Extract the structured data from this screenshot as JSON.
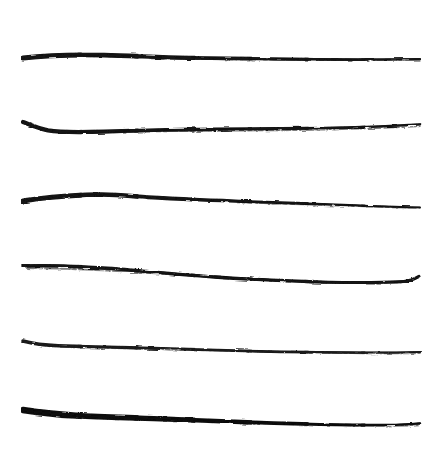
{
  "image": {
    "kind": "scanned-drawing",
    "subject": "six hand-drawn horizontal brush-ink lines",
    "width": 448,
    "height": 466,
    "background_color": "#ffffff",
    "ink_color": "#111111",
    "medium": "brush / marker on paper",
    "has_text": false,
    "has_border": false
  },
  "strokes": [
    {
      "id": "stroke-1",
      "index": 1,
      "label": "top line",
      "start_x": 23,
      "end_x": 420,
      "baseline_y": 57,
      "thickness_left": 5.2,
      "thickness_right": 2.2,
      "color": "#121212",
      "description": "thick blunt entry at left, gentle wave, tapers and dries out toward the right",
      "path": "M23,58 C48,55.2 76,54.6 104,55.2 C132,55.8 160,57.4 188,57.8 C216,58.2 244,58.4 272,58.8 C300,59.2 330,59.6 358,59.6 C382,59.6 402,59.4 420,59.2",
      "texture_path": "M150,58.6 C190,59.2 232,59.6 274,60.0 C316,60.4 360,60.4 420,60.0"
    },
    {
      "id": "stroke-2",
      "index": 2,
      "label": "second line with left hook",
      "start_x": 23,
      "end_x": 420,
      "baseline_y": 128,
      "thickness_left": 4.4,
      "thickness_right": 2.4,
      "color": "#121212",
      "description": "distinct downward hook at the left end, flat through the middle, lifts slightly at the right tip",
      "path": "M23,122 C30,124.6 38,128.4 48,130.4 C62,132.8 80,132.4 104,131.6 C140,130.4 176,129.6 212,129.2 C250,128.8 288,128.6 326,128.0 C356,127.4 390,126.2 420,124.4",
      "texture_path": "M112,132.2 C160,131.6 210,131.0 262,130.6 C314,130.2 368,129.0 420,126.4"
    },
    {
      "id": "stroke-3",
      "index": 3,
      "label": "third line, dry-brush right half",
      "start_x": 23,
      "end_x": 420,
      "baseline_y": 199,
      "thickness_left": 5.0,
      "thickness_right": 1.8,
      "color": "#121212",
      "description": "dark and heavy on the left half, thins into a speckled dry-brush taper that drifts downward to the right",
      "path": "M23,201 C46,197.2 72,195.2 98,194.6 C116,194.2 130,196.0 148,197.2 C182,199.4 216,200.4 250,201.6 C286,202.8 322,204.0 356,205.4 C380,206.4 402,207.2 420,207.4",
      "texture_path": "M238,202.6 C274,203.8 312,205.0 348,206.2 C378,207.2 402,208.0 420,208.2"
    },
    {
      "id": "stroke-4",
      "index": 4,
      "label": "fourth line, downward slope with end flick",
      "start_x": 23,
      "end_x": 420,
      "baseline_y": 272,
      "thickness_left": 3.6,
      "thickness_right": 3.0,
      "color": "#121212",
      "description": "slopes steadily downward from left to right with a shallow sag near the middle, ending in a small upward flick",
      "path": "M23,266 C52,265.0 82,266.4 112,268.6 C146,271.2 180,274.6 214,277.0 C252,279.6 290,281.2 328,282.2 C356,282.8 382,282.6 404,281.4 C410,281.0 414,279.2 419,276.4",
      "texture_path": "M27,268.2 C70,268.4 112,270.6 156,273.4 C206,276.6 258,279.8 310,281.6 C344,282.8 376,283.4 402,282.6"
    },
    {
      "id": "stroke-5",
      "index": 5,
      "label": "fifth line, thin dry stroke",
      "start_x": 23,
      "end_x": 420,
      "baseline_y": 344,
      "thickness_left": 3.4,
      "thickness_right": 2.2,
      "color": "#1a1a1a",
      "description": "the thinnest and lightest stroke, small hook at the left, rough speckled texture, drifting gently downward",
      "path": "M23,341 C32,343.4 44,345.2 58,345.8 C88,346.8 120,347.2 152,348.2 C188,349.4 224,350.6 260,351.4 C296,352.2 332,352.4 368,352.6 C390,352.6 406,352.4 420,352.0",
      "texture_path": "M60,347.2 C104,348.0 150,349.2 196,350.2 C248,351.4 300,352.6 352,353.4 C382,353.8 404,353.8 420,353.4"
    },
    {
      "id": "stroke-6",
      "index": 6,
      "label": "bottom line, heaviest stroke",
      "start_x": 23,
      "end_x": 420,
      "baseline_y": 414,
      "thickness_left": 6.4,
      "thickness_right": 2.4,
      "color": "#0d0d0d",
      "description": "boldest stroke of the set, sharp pointed wedge entry at the left that swells to full weight, then tapers to a thin tail at the right",
      "path": "M23,410 C38,412.4 56,414.4 76,415.6 C102,417.2 128,417.6 154,418.6 C194,420.2 234,422.0 274,423.2 C312,424.4 350,425.2 386,425.0 C400,424.8 412,424.2 420,423.4",
      "texture_path": "M70,416.8 C112,418.4 156,420.0 200,421.4 C250,423.0 302,424.6 352,425.6 C382,426.2 404,426.2 420,425.4"
    }
  ]
}
